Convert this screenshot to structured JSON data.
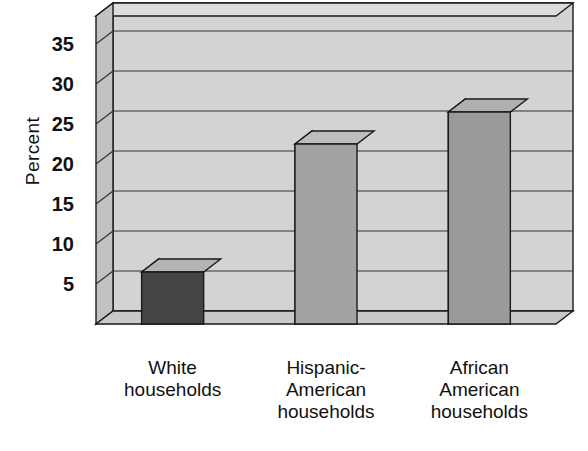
{
  "chart_data": {
    "type": "bar",
    "title": "",
    "xlabel": "",
    "ylabel": "Percent",
    "categories": [
      "White\nhouseholds",
      "Hispanic-\nAmerican\nhouseholds",
      "African\nAmerican\nhouseholds"
    ],
    "values": [
      6.5,
      22.5,
      26.5
    ],
    "ylim": [
      0,
      38.5
    ],
    "yticks": [
      5,
      10,
      15,
      20,
      25,
      30,
      35
    ],
    "ytick_labels": [
      "5",
      "10",
      "15",
      "20",
      "25",
      "30",
      "35"
    ],
    "grid": true,
    "legend": "none",
    "style": "3d-bar",
    "bar_colors": [
      "#444444",
      "#a3a3a3",
      "#9a9a9a"
    ]
  },
  "axis": {
    "y_title": "Percent"
  },
  "colors": {
    "background": "#ffffff",
    "plot_wall": "#d3d3d3",
    "plot_wall_light": "#dcdcdc",
    "plot_floor": "#c9c9c9",
    "side_wall": "#c2c2c2",
    "outline": "#1a1a1a",
    "gridline": "#333333",
    "bar1_front": "#444444",
    "bar1_top": "#b4b4b4",
    "bar1_side": "#d0d0d0",
    "bar2_front": "#a3a3a3",
    "bar2_top": "#bdbdbd",
    "bar2_side": "#c9c9c9",
    "bar3_front": "#9a9a9a",
    "bar3_top": "#b0b0b0",
    "bar3_side": "#bdbdbd"
  }
}
